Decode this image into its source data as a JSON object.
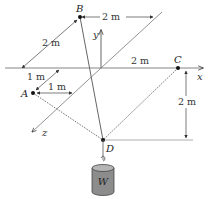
{
  "points": {
    "A": "A",
    "B": "B",
    "C": "C",
    "D": "D"
  },
  "axes": {
    "x": "x",
    "y": "y",
    "z": "z"
  },
  "dimensions": {
    "B_to_yaxis_horizontal": "2 m",
    "B_to_xaxis_along_z": "2 m",
    "origin_to_C": "2 m",
    "C_to_D_vertical": "2 m",
    "A_along_z": "1 m",
    "A_to_zaxis": "1 m"
  },
  "weight": {
    "label": "W"
  },
  "colors": {
    "line": "#555555",
    "weight_fill": "#8c8c8c",
    "weight_top": "#b5b5b5"
  }
}
